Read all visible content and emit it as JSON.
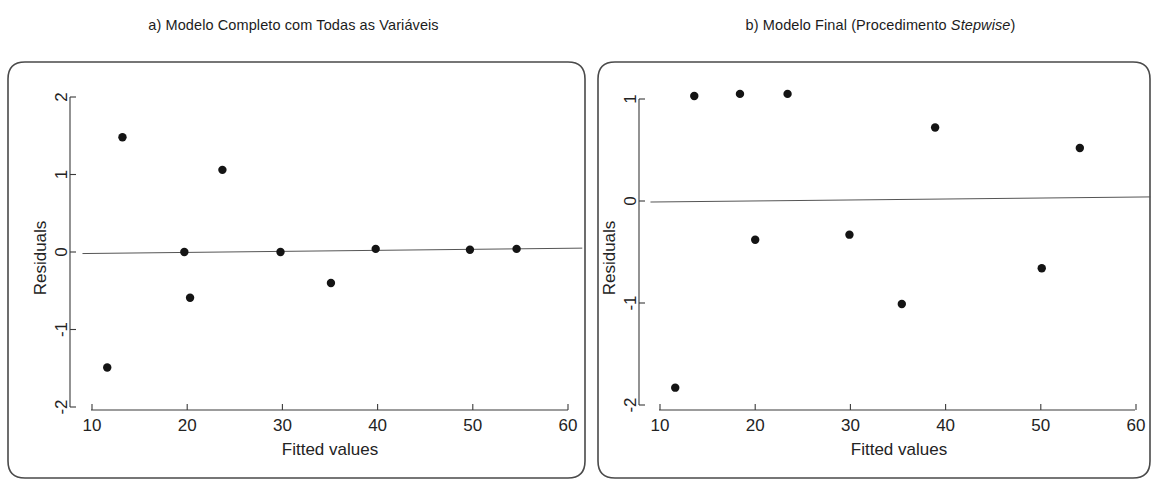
{
  "figure": {
    "background": "#ffffff",
    "ink_color": "#1a1a1a",
    "point_color": "#141414",
    "axis_color": "#3a3a3a",
    "frame_color": "#4a4a4a"
  },
  "panels": [
    {
      "id": "panel-a",
      "label": "a)",
      "title_plain": "a) Modelo Completo com Todas as Variáveis",
      "title_prefix": "a) Modelo Completo com Todas as ",
      "title_italic": "",
      "title_suffix": "Variáveis"
    },
    {
      "id": "panel-b",
      "label": "b)",
      "title_plain": "b) Modelo Final (Procedimento Stepwise)",
      "title_prefix": "b) Modelo Final (Procedimento ",
      "title_italic": "Stepwise",
      "title_suffix": ")"
    }
  ],
  "chart_data": [
    {
      "type": "scatter",
      "title": "a) Modelo Completo com Todas as Variáveis",
      "xlabel": "Fitted values",
      "ylabel": "Residuals",
      "xlim": [
        9.0,
        61.5
      ],
      "ylim": [
        -2.22,
        2.18
      ],
      "xticks": [
        10,
        20,
        30,
        40,
        50,
        60
      ],
      "xtick_labels": [
        "10",
        "20",
        "30",
        "40",
        "50",
        "60"
      ],
      "yticks": [
        -2,
        -1,
        0,
        1,
        2
      ],
      "ytick_labels": [
        "-2",
        "-1",
        "0",
        "1",
        "2"
      ],
      "grid": false,
      "legend": "none",
      "reference_line": {
        "label": "lowess/zero line",
        "x": [
          9.0,
          61.5
        ],
        "y": [
          -0.02,
          0.05
        ]
      },
      "x": [
        11.6,
        13.2,
        19.7,
        20.3,
        23.7,
        29.8,
        35.1,
        39.8,
        49.7,
        54.6
      ],
      "y": [
        -1.49,
        1.48,
        0.0,
        -0.59,
        1.06,
        0.0,
        -0.4,
        0.04,
        0.03,
        0.04
      ]
    },
    {
      "type": "scatter",
      "title": "b) Modelo Final (Procedimento Stepwise)",
      "xlabel": "Fitted values",
      "ylabel": "Residuals",
      "xlim": [
        9.0,
        61.5
      ],
      "ylim": [
        -2.22,
        1.32
      ],
      "xticks": [
        10,
        20,
        30,
        40,
        50,
        60
      ],
      "xtick_labels": [
        "10",
        "20",
        "30",
        "40",
        "50",
        "60"
      ],
      "yticks": [
        -2,
        -1,
        0,
        1
      ],
      "ytick_labels": [
        "-2",
        "-1",
        "0",
        "1"
      ],
      "grid": false,
      "legend": "none",
      "reference_line": {
        "label": "lowess/zero line",
        "x": [
          9.0,
          61.5
        ],
        "y": [
          -0.01,
          0.04
        ]
      },
      "x": [
        11.6,
        13.6,
        18.4,
        20.0,
        23.4,
        29.9,
        35.4,
        38.9,
        50.1,
        54.1
      ],
      "y": [
        -1.83,
        1.03,
        1.05,
        -0.38,
        1.05,
        -0.33,
        -1.01,
        0.72,
        -0.66,
        0.52
      ]
    }
  ]
}
